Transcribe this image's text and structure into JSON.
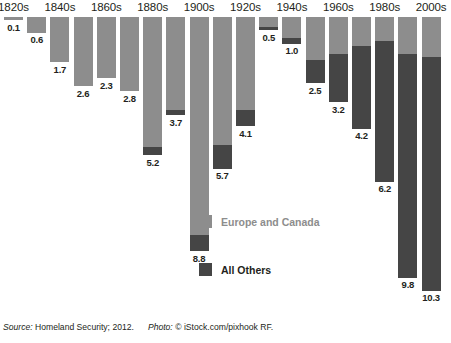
{
  "chart_data": {
    "type": "bar",
    "title": "",
    "subtitle": "",
    "xlabel": "",
    "ylabel": "",
    "orientation": "vertical-downward",
    "stacked": true,
    "grid": false,
    "legend_position": "inside-center",
    "value_unit": "millions",
    "categories": [
      "1820s",
      "1830s",
      "1840s",
      "1850s",
      "1860s",
      "1870s",
      "1880s",
      "1890s",
      "1900s",
      "1910s",
      "1920s",
      "1930s",
      "1940s",
      "1950s",
      "1960s",
      "1970s",
      "1980s",
      "1990s",
      "2000s"
    ],
    "axis_tick_labels": [
      "1820s",
      "1840s",
      "1860s",
      "1880s",
      "1900s",
      "1920s",
      "1940s",
      "1960s",
      "1980s",
      "2000s"
    ],
    "totals": [
      0.1,
      0.6,
      1.7,
      2.6,
      2.3,
      2.8,
      5.2,
      3.7,
      8.8,
      5.7,
      4.1,
      0.5,
      1.0,
      2.5,
      3.2,
      4.2,
      6.2,
      9.8,
      10.3
    ],
    "series": [
      {
        "name": "Europe and Canada",
        "color": "#8d8d8d",
        "values": [
          0.1,
          0.6,
          1.7,
          2.6,
          2.3,
          2.8,
          4.9,
          3.5,
          8.2,
          4.8,
          3.5,
          0.4,
          0.8,
          1.6,
          1.4,
          1.1,
          0.9,
          1.4,
          1.5
        ]
      },
      {
        "name": "All Others",
        "color": "#454545",
        "values": [
          0.0,
          0.0,
          0.0,
          0.0,
          0.0,
          0.0,
          0.3,
          0.2,
          0.6,
          0.9,
          0.6,
          0.1,
          0.2,
          0.9,
          1.8,
          3.1,
          5.3,
          8.4,
          8.8
        ]
      }
    ],
    "data_labels": [
      "0.1",
      "0.6",
      "1.7",
      "2.6",
      "2.3",
      "2.8",
      "5.2",
      "3.7",
      "8.8",
      "5.7",
      "4.1",
      "0.5",
      "1.0",
      "2.5",
      "3.2",
      "4.2",
      "6.2",
      "9.8",
      "10.3"
    ]
  },
  "axis": {
    "ticks": [
      {
        "label": "1820s",
        "bar_index": 0
      },
      {
        "label": "1840s",
        "bar_index": 2
      },
      {
        "label": "1860s",
        "bar_index": 4
      },
      {
        "label": "1880s",
        "bar_index": 6
      },
      {
        "label": "1900s",
        "bar_index": 8
      },
      {
        "label": "1920s",
        "bar_index": 10
      },
      {
        "label": "1940s",
        "bar_index": 12
      },
      {
        "label": "1960s",
        "bar_index": 14
      },
      {
        "label": "1980s",
        "bar_index": 16
      },
      {
        "label": "2000s",
        "bar_index": 18
      }
    ]
  },
  "legend": {
    "europe_label": "Europe and Canada",
    "others_label": "All Others"
  },
  "footer": {
    "source_prefix": "Source:",
    "source_text": "Homeland Security; 2012.",
    "photo_prefix": "Photo:",
    "photo_text": "© iStock.com/pixhook RF."
  }
}
